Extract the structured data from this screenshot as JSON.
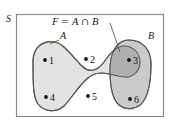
{
  "figure": {
    "type": "venn-diagram",
    "universe_label": "S",
    "set_a_label": "A",
    "set_b_label": "B",
    "formula": {
      "lhs": "F",
      "equals": "=",
      "operand_left": "A",
      "operator": "∩",
      "operand_right": "B",
      "full_text": "F = A ∩ B"
    },
    "elements": [
      {
        "label": "1",
        "x": 45,
        "y": 60,
        "region": "A-only"
      },
      {
        "label": "2",
        "x": 86,
        "y": 59,
        "region": "A-only"
      },
      {
        "label": "3",
        "x": 129,
        "y": 60,
        "region": "A-intersect-B"
      },
      {
        "label": "4",
        "x": 46,
        "y": 97,
        "region": "outside"
      },
      {
        "label": "5",
        "x": 88,
        "y": 96,
        "region": "A-only"
      },
      {
        "label": "6",
        "x": 130,
        "y": 99,
        "region": "B-only"
      }
    ],
    "colors": {
      "set_a_fill": "#e3e3e1",
      "set_b_fill": "#c9c9c7",
      "intersection_fill": "#b4b4b2",
      "outline": "#5a5a58",
      "frame": "#8a8a88",
      "dot": "#141414",
      "text": "#1a1a1a",
      "background": "#ffffff"
    },
    "frame": {
      "x": 16,
      "y": 14,
      "width": 148,
      "height": 103
    }
  }
}
